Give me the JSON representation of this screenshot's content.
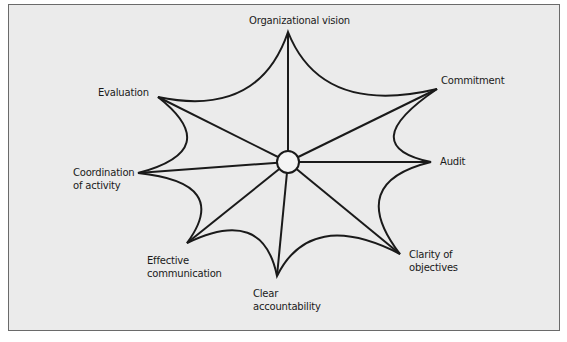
{
  "diagram": {
    "type": "web",
    "center": {
      "x": 288,
      "y": 162,
      "r": 11
    },
    "stroke_color": "#1a1a1a",
    "background_color": "#ebebeb",
    "nodes": [
      {
        "id": "organizational-vision",
        "label": "Organizational vision",
        "x": 288,
        "y": 32
      },
      {
        "id": "commitment",
        "label": "Commitment",
        "x": 437,
        "y": 89
      },
      {
        "id": "audit",
        "label": "Audit",
        "x": 431,
        "y": 162
      },
      {
        "id": "clarity-of-objectives",
        "label": "Clarity of\nobjectives",
        "x": 400,
        "y": 254
      },
      {
        "id": "clear-accountability",
        "label": "Clear\naccountability",
        "x": 277,
        "y": 276
      },
      {
        "id": "effective-communication",
        "label": "Effective\ncommunication",
        "x": 187,
        "y": 243
      },
      {
        "id": "coordination-of-activity",
        "label": "Coordination\nof activity",
        "x": 138,
        "y": 173
      },
      {
        "id": "evaluation",
        "label": "Evaluation",
        "x": 158,
        "y": 97
      }
    ]
  }
}
